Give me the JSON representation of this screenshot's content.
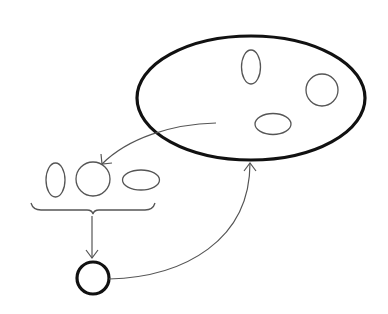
{
  "diagram": {
    "type": "set-selection-flow",
    "colors": {
      "background": "#ffffff",
      "thick_stroke": "#111111",
      "thin_stroke": "#555555"
    },
    "nodes": [
      {
        "id": "large-set",
        "shape": "ellipse",
        "cx": 251,
        "cy": 98,
        "rx": 114,
        "ry": 62,
        "weight": "bold"
      },
      {
        "id": "set-member-vertical-ellipse",
        "shape": "ellipse",
        "cx": 251,
        "cy": 67,
        "rx": 9.5,
        "ry": 17,
        "weight": "thin",
        "parent": "large-set"
      },
      {
        "id": "set-member-circle",
        "shape": "circle",
        "cx": 322,
        "cy": 90,
        "r": 16,
        "weight": "thin",
        "parent": "large-set"
      },
      {
        "id": "set-member-horizontal-ellipse",
        "shape": "ellipse",
        "cx": 273,
        "cy": 124,
        "rx": 18,
        "ry": 10.5,
        "weight": "thin",
        "parent": "large-set"
      },
      {
        "id": "sample-vertical-ellipse",
        "shape": "ellipse",
        "cx": 55.5,
        "cy": 180,
        "rx": 9.5,
        "ry": 17,
        "weight": "thin"
      },
      {
        "id": "sample-circle",
        "shape": "circle",
        "cx": 93,
        "cy": 179,
        "r": 17,
        "weight": "thin"
      },
      {
        "id": "sample-horizontal-ellipse",
        "shape": "ellipse",
        "cx": 141,
        "cy": 180,
        "rx": 18.5,
        "ry": 10,
        "weight": "thin"
      },
      {
        "id": "result-circle",
        "shape": "circle",
        "cx": 93,
        "cy": 278,
        "r": 16,
        "weight": "bold"
      }
    ],
    "edges": [
      {
        "id": "sample-arrow",
        "from": "large-set",
        "to": "sample-circle",
        "path": "M216,123 C172,124 128,138 102,164"
      },
      {
        "id": "reduce-arrow",
        "from": "sample-group",
        "to": "result-circle",
        "path": "M92,216 L92,258"
      },
      {
        "id": "feedback-arrow",
        "from": "result-circle",
        "to": "large-set",
        "path": "M109,279 C185,277 250,240 250,163"
      }
    ],
    "brace": {
      "id": "sample-group-brace",
      "x1": 31,
      "x2": 155,
      "y_top": 203,
      "y_mid": 210,
      "tip_x": 93,
      "tip_y": 214
    }
  }
}
